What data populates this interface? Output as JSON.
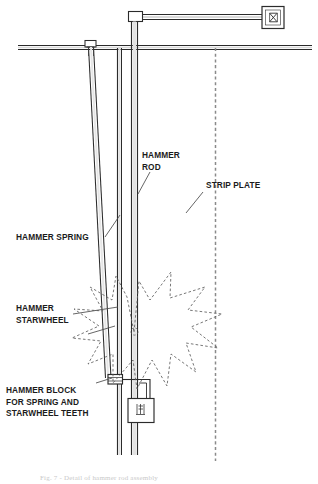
{
  "figure": {
    "caption": "Fig. 7 - Detail of hammer rod assembly",
    "background_color": "#ffffff",
    "line_color": "#2b2b2b",
    "dash_color": "#7a7a7a",
    "text_color": "#1b1b1b"
  },
  "labels": {
    "hammer_rod": "HAMMER\nROD",
    "strip_plate": "STRIP PLATE",
    "hammer_spring": "HAMMER SPRING",
    "hammer_starwheel": "HAMMER\nSTARWHEEL",
    "hammer_block": "HAMMER BLOCK\nFOR SPRING AND\nSTARWHEEL TEETH"
  },
  "parts": {
    "top_rail": "horizontal-rail",
    "spring_anchor_block": "spring-anchor-block",
    "top_connector_block": "rod-top-connector-block",
    "arm": "horizontal-arm",
    "end_fixture": "end-fixture-box",
    "end_fixture_symbol": "bowtie-symbol",
    "lower_fixture": "lower-fixture-box",
    "starwheel": "starwheel-burst",
    "pivot": "starwheel-pivot"
  }
}
